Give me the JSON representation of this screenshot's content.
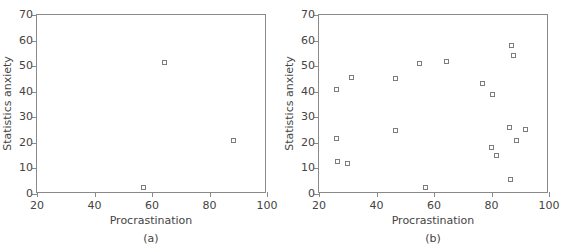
{
  "figure": {
    "cropped_title_remnant": "",
    "panels": [
      {
        "id": "a",
        "caption": "(a)",
        "xlabel": "Procrastination",
        "ylabel": "Statistics anxiety"
      },
      {
        "id": "b",
        "caption": "(b)",
        "xlabel": "Procrastination",
        "ylabel": "Statistics anxiety"
      }
    ]
  },
  "axes": {
    "xticks": [
      20,
      40,
      60,
      80,
      100
    ],
    "yticks": [
      0,
      10,
      20,
      30,
      40,
      50,
      60,
      70
    ],
    "xlim": [
      20,
      100
    ],
    "ylim": [
      0,
      70
    ],
    "marker_color": "#7d7d7d",
    "axis_color": "#8a8a8a",
    "text_color": "#444444"
  },
  "chart_data": [
    {
      "type": "scatter",
      "title": "(a)",
      "xlabel": "Procrastination",
      "ylabel": "Statistics anxiety",
      "xlim": [
        20,
        100
      ],
      "ylim": [
        0,
        70
      ],
      "grid": false,
      "legend": "none",
      "points": [
        {
          "x": 57.0,
          "y": 2.5
        },
        {
          "x": 64.5,
          "y": 51.5
        },
        {
          "x": 88.5,
          "y": 21.0
        }
      ]
    },
    {
      "type": "scatter",
      "title": "(b)",
      "xlabel": "Procrastination",
      "ylabel": "Statistics anxiety",
      "xlim": [
        20,
        100
      ],
      "ylim": [
        0,
        70
      ],
      "grid": false,
      "legend": "none",
      "points": [
        {
          "x": 26.0,
          "y": 40.8
        },
        {
          "x": 31.3,
          "y": 45.5
        },
        {
          "x": 26.0,
          "y": 21.7
        },
        {
          "x": 26.6,
          "y": 12.7
        },
        {
          "x": 30.0,
          "y": 11.8
        },
        {
          "x": 46.5,
          "y": 45.0
        },
        {
          "x": 46.5,
          "y": 24.9
        },
        {
          "x": 55.0,
          "y": 51.0
        },
        {
          "x": 57.0,
          "y": 2.5
        },
        {
          "x": 64.5,
          "y": 51.8
        },
        {
          "x": 76.8,
          "y": 43.1
        },
        {
          "x": 80.3,
          "y": 39.0
        },
        {
          "x": 80.0,
          "y": 18.1
        },
        {
          "x": 81.6,
          "y": 15.1
        },
        {
          "x": 86.8,
          "y": 58.0
        },
        {
          "x": 87.8,
          "y": 54.0
        },
        {
          "x": 86.4,
          "y": 26.1
        },
        {
          "x": 91.9,
          "y": 25.1
        },
        {
          "x": 88.7,
          "y": 21.1
        },
        {
          "x": 86.6,
          "y": 5.6
        }
      ]
    }
  ]
}
